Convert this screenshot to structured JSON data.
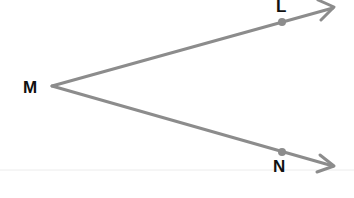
{
  "diagram": {
    "type": "angle",
    "name": "angle LMN",
    "vertex": {
      "label": "M",
      "x": 52,
      "y": 86
    },
    "points": [
      {
        "label": "L",
        "x": 282,
        "y": 22
      },
      {
        "label": "N",
        "x": 282,
        "y": 152
      }
    ],
    "rays": [
      {
        "from": "M",
        "through": "L",
        "end": {
          "x": 333,
          "y": 7
        }
      },
      {
        "from": "M",
        "through": "N",
        "end": {
          "x": 333,
          "y": 166
        }
      }
    ],
    "colors": {
      "ray": "#8c8c8c",
      "point": "#8c8c8c",
      "label": "#111111",
      "baseline": "#ececec"
    }
  },
  "labels": {
    "M": "M",
    "L": "L",
    "N": "N"
  }
}
